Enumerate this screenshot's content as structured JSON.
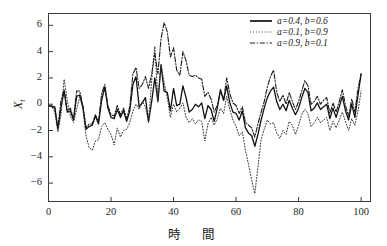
{
  "chart_data": {
    "type": "line",
    "title": "",
    "xlabel": "時　間",
    "ylabel": "X",
    "ylabel_sub": "t",
    "xlim": [
      0,
      103
    ],
    "ylim": [
      -7.4,
      6.9
    ],
    "xticks": [
      "0",
      "20",
      "40",
      "60",
      "80",
      "100"
    ],
    "xtick_values": [
      0,
      20,
      40,
      60,
      80,
      100
    ],
    "yticks": [
      "6",
      "4",
      "2",
      "0",
      "-2",
      "-4",
      "-6"
    ],
    "ytick_values": [
      6,
      4,
      2,
      0,
      -2,
      -4,
      -6
    ],
    "grid": false,
    "legend_position": "top-right",
    "frame": true,
    "axis_color": "#3b3b3b",
    "series": [
      {
        "name": "a=0.4,  b=0.6",
        "style": "solid",
        "color": "#111111",
        "width": 1.3,
        "values": [
          -0.1,
          -0.15,
          -0.2,
          -1.9,
          -0.2,
          1.0,
          -0.6,
          -0.5,
          -1.2,
          0.6,
          0.7,
          -0.2,
          -1.9,
          -1.7,
          -1.6,
          -0.9,
          -1.5,
          0.3,
          1.3,
          -0.3,
          -1.0,
          -1.1,
          -0.4,
          -1.0,
          -0.5,
          -1.3,
          -0.5,
          1.5,
          2.1,
          -0.2,
          0.1,
          0.5,
          -1.3,
          0.2,
          2.0,
          0.2,
          3.0,
          1.0,
          0.9,
          -0.5,
          1.2,
          -0.1,
          0.0,
          1.4,
          0.5,
          -0.6,
          -0.4,
          0.0,
          -0.2,
          0.1,
          -1.1,
          -0.1,
          -0.4,
          -1.3,
          -0.3,
          1.1,
          0.3,
          1.4,
          0.1,
          -0.6,
          -0.7,
          -1.2,
          -0.5,
          -1.8,
          -2.2,
          -2.4,
          -3.2,
          -2.3,
          -1.2,
          -0.3,
          0.5,
          1.0,
          1.3,
          0.2,
          -0.4,
          0.0,
          -0.5,
          0.3,
          -0.3,
          -0.8,
          -0.3,
          0.5,
          1.2,
          0.9,
          -0.5,
          -0.3,
          0.1,
          -0.4,
          -0.2,
          0.0,
          -1.1,
          -0.3,
          -1.0,
          -0.2,
          0.6,
          -0.5,
          -1.2,
          0.0,
          -1.0,
          0.7,
          2.3
        ]
      },
      {
        "name": "a=0.1,  b=0.9",
        "style": "dotted",
        "color": "#333333",
        "width": 1.0,
        "values": [
          -0.1,
          -0.1,
          -0.6,
          -2.1,
          -0.8,
          1.9,
          0.3,
          -0.9,
          -1.4,
          -0.4,
          0.6,
          -0.4,
          -2.4,
          -3.3,
          -3.5,
          -2.8,
          -2.7,
          -1.7,
          -1.4,
          -1.9,
          -2.3,
          -3.1,
          -1.8,
          -2.5,
          -2.0,
          -1.9,
          -1.4,
          -0.5,
          0.0,
          -0.4,
          0.2,
          -0.2,
          -1.4,
          1.8,
          4.4,
          0.3,
          3.0,
          1.6,
          0.5,
          -1.0,
          0.0,
          -0.6,
          -0.3,
          0.1,
          -1.0,
          -1.4,
          -1.1,
          -1.5,
          -1.2,
          -1.3,
          -2.8,
          -1.5,
          -1.0,
          -1.6,
          -1.1,
          -0.3,
          -0.7,
          0.6,
          -0.4,
          -1.2,
          -1.7,
          -2.4,
          -2.1,
          -3.5,
          -4.6,
          -5.8,
          -6.8,
          -4.8,
          -2.7,
          -1.9,
          -1.2,
          -1.5,
          -1.4,
          -2.2,
          -2.6,
          -2.0,
          -2.3,
          -1.3,
          -1.6,
          -2.3,
          -1.6,
          -0.8,
          -0.4,
          -0.7,
          -1.7,
          -1.4,
          -1.0,
          -1.4,
          -1.2,
          -1.0,
          -2.0,
          -1.3,
          -1.8,
          -1.2,
          -0.6,
          -1.3,
          -2.0,
          -1.1,
          -1.6,
          -0.5,
          1.0
        ]
      },
      {
        "name": "a=0.9,  b=0.1",
        "style": "dashdot",
        "color": "#1a1a1a",
        "width": 1.1,
        "values": [
          -0.1,
          -0.2,
          -0.3,
          -1.8,
          0.3,
          1.1,
          -0.5,
          -0.3,
          -1.1,
          1.0,
          1.0,
          -0.1,
          -1.8,
          -1.5,
          -1.5,
          -0.8,
          -1.3,
          0.8,
          1.5,
          -0.1,
          -0.8,
          -0.9,
          -0.1,
          -0.8,
          -0.3,
          -1.1,
          -0.2,
          2.3,
          2.8,
          1.2,
          1.5,
          2.1,
          1.2,
          2.3,
          3.9,
          2.3,
          5.0,
          6.2,
          5.5,
          3.6,
          4.3,
          2.6,
          2.2,
          4.0,
          3.3,
          2.2,
          2.1,
          2.2,
          2.0,
          1.9,
          0.6,
          0.9,
          0.4,
          -0.6,
          -0.1,
          1.0,
          0.3,
          2.0,
          0.8,
          0.1,
          -0.1,
          -0.7,
          -0.2,
          -1.4,
          -1.6,
          -1.8,
          -2.5,
          -1.5,
          -0.6,
          0.2,
          1.3,
          2.1,
          2.6,
          0.9,
          0.2,
          0.7,
          0.0,
          0.9,
          0.2,
          -0.4,
          0.2,
          1.0,
          1.8,
          1.4,
          0.0,
          0.2,
          0.6,
          0.0,
          0.3,
          0.5,
          -0.7,
          0.1,
          -0.6,
          0.2,
          1.1,
          -0.1,
          -0.9,
          0.4,
          -0.6,
          1.2,
          2.3
        ]
      }
    ]
  }
}
